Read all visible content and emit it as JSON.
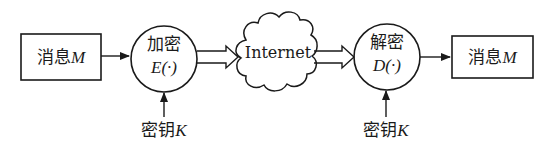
{
  "diagram": {
    "nodes": [
      {
        "id": "msg_src",
        "shape": "rectangle",
        "text": "消息",
        "var": "M"
      },
      {
        "id": "encrypt",
        "shape": "circle",
        "text": "加密",
        "func": "E(·)"
      },
      {
        "id": "internet",
        "shape": "cloud",
        "text": "Internet"
      },
      {
        "id": "decrypt",
        "shape": "circle",
        "text": "解密",
        "func": "D(·)"
      },
      {
        "id": "msg_dst",
        "shape": "rectangle",
        "text": "消息",
        "var": "M"
      },
      {
        "id": "key_enc",
        "shape": "label",
        "text": "密钥",
        "var": "K"
      },
      {
        "id": "key_dec",
        "shape": "label",
        "text": "密钥",
        "var": "K"
      }
    ],
    "edges": [
      {
        "from": "msg_src",
        "to": "encrypt",
        "style": "solid-arrow"
      },
      {
        "from": "encrypt",
        "to": "internet",
        "style": "hollow-double-arrow"
      },
      {
        "from": "internet",
        "to": "decrypt",
        "style": "hollow-double-arrow"
      },
      {
        "from": "decrypt",
        "to": "msg_dst",
        "style": "solid-arrow"
      },
      {
        "from": "key_enc",
        "to": "encrypt",
        "style": "solid-arrow"
      },
      {
        "from": "key_dec",
        "to": "decrypt",
        "style": "solid-arrow"
      }
    ]
  },
  "colors": {
    "stroke": "#1a1a1a",
    "background": "#ffffff"
  }
}
